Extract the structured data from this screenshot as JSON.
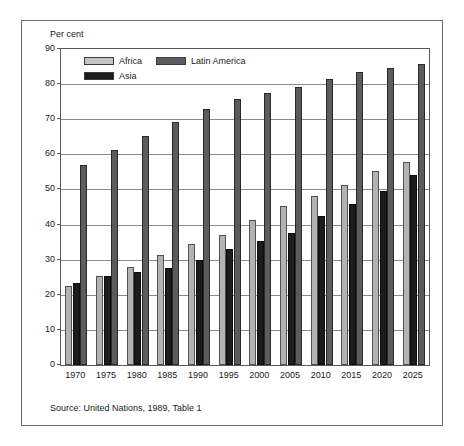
{
  "figure": {
    "axis_unit_label": "Per cent",
    "source_note": "Source: United Nations, 1989, Table 1"
  },
  "legend": {
    "items": [
      {
        "label": "Africa",
        "key": "africa",
        "color": "#b3b3b3"
      },
      {
        "label": "Latin America",
        "key": "latam",
        "color": "#5c5c5c"
      },
      {
        "label": "Asia",
        "key": "asia",
        "color": "#1c1c1c"
      }
    ]
  },
  "chart_data": {
    "type": "bar",
    "title": "",
    "subtitle": "",
    "xlabel": "",
    "ylabel": "Per cent",
    "ylim": [
      0,
      90
    ],
    "ytick_step": 10,
    "yticks": [
      0,
      10,
      20,
      30,
      40,
      50,
      60,
      70,
      80,
      90
    ],
    "grid": true,
    "legend_position": "top-left-inside",
    "annotations": [
      "Source: United Nations, 1989, Table 1"
    ],
    "categories": [
      "1970",
      "1975",
      "1980",
      "1985",
      "1990",
      "1995",
      "2000",
      "2005",
      "2010",
      "2015",
      "2020",
      "2025"
    ],
    "series": [
      {
        "name": "Africa",
        "color": "#b3b3b3",
        "values": [
          22.4,
          25.3,
          28.0,
          31.3,
          34.5,
          37.0,
          41.4,
          45.2,
          48.2,
          51.4,
          55.4,
          57.8
        ]
      },
      {
        "name": "Asia",
        "color": "#1c1c1c",
        "values": [
          23.5,
          25.3,
          26.4,
          27.7,
          29.9,
          33.0,
          35.4,
          37.7,
          42.5,
          45.9,
          49.6,
          54.2
        ]
      },
      {
        "name": "Latin America",
        "color": "#5c5c5c",
        "values": [
          57.0,
          61.3,
          65.3,
          69.2,
          73.0,
          75.7,
          77.5,
          79.2,
          81.6,
          83.5,
          84.5,
          85.8
        ]
      }
    ]
  }
}
